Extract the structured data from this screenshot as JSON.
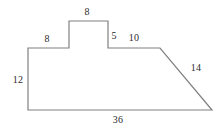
{
  "figure": {
    "kind": "polygon-diagram",
    "title": "",
    "canvas": {
      "width": 223,
      "height": 129
    },
    "style": {
      "stroke_color": "#808080",
      "stroke_width": 1.2,
      "fill_color": "none",
      "label_color": "#2b2b2b",
      "background_color": "#ffffff"
    },
    "vertices": [
      {
        "name": "top-left-upper",
        "x": 28,
        "y": 48
      },
      {
        "name": "step-base-left",
        "x": 69,
        "y": 48
      },
      {
        "name": "step-top-left",
        "x": 69,
        "y": 21
      },
      {
        "name": "step-top-right",
        "x": 108,
        "y": 21
      },
      {
        "name": "step-base-right",
        "x": 108,
        "y": 48
      },
      {
        "name": "ledge-right",
        "x": 160,
        "y": 48
      },
      {
        "name": "bottom-right",
        "x": 212,
        "y": 110
      },
      {
        "name": "bottom-left",
        "x": 28,
        "y": 110
      }
    ],
    "edges": [
      {
        "name": "edge-top-left-horizontal",
        "label": "8",
        "label_x": 47,
        "label_y": 39
      },
      {
        "name": "edge-step-top-horizontal",
        "label": "8",
        "label_x": 87,
        "label_y": 12
      },
      {
        "name": "edge-step-right-vertical",
        "label": "5",
        "label_x": 114,
        "label_y": 36
      },
      {
        "name": "edge-ledge-horizontal",
        "label": "10",
        "label_x": 134,
        "label_y": 38
      },
      {
        "name": "edge-diagonal",
        "label": "14",
        "label_x": 196,
        "label_y": 68
      },
      {
        "name": "edge-left-vertical",
        "label": "12",
        "label_x": 18,
        "label_y": 80
      },
      {
        "name": "edge-bottom-horizontal",
        "label": "36",
        "label_x": 118,
        "label_y": 120
      }
    ]
  }
}
